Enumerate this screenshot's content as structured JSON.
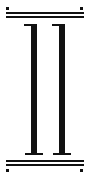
{
  "figure": {
    "numeral": "II",
    "ink_color": "#111111",
    "background": "#ffffff"
  }
}
